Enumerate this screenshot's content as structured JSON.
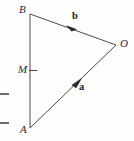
{
  "figure": {
    "kind": "vector-triangle-diagram",
    "background_color": "#fdfdfc",
    "stroke_color": "#4a4a4a",
    "label_color": "#2b2b2b",
    "vertices": [
      {
        "name": "B",
        "label": "B",
        "x": 30,
        "y": 14
      },
      {
        "name": "O",
        "label": "O",
        "x": 116,
        "y": 45
      },
      {
        "name": "A",
        "label": "A",
        "x": 30,
        "y": 128
      },
      {
        "name": "M",
        "label": "M",
        "x": 30,
        "y": 70
      }
    ],
    "segments": [
      {
        "name": "segment-BA",
        "from": "B",
        "to": "A"
      },
      {
        "name": "segment-BO",
        "from": "B",
        "to": "O"
      },
      {
        "name": "segment-AO",
        "from": "A",
        "to": "O"
      }
    ],
    "vectors": [
      {
        "name": "vector-b",
        "label": "b",
        "from": "O",
        "to": "B",
        "arrow_x": 71,
        "arrow_y": 28,
        "label_x": 72,
        "label_y": 11
      },
      {
        "name": "vector-a",
        "label": "a",
        "from": "A",
        "to": "O",
        "arrow_x": 77,
        "arrow_y": 83,
        "label_x": 79,
        "label_y": 82
      }
    ],
    "midpoint_tick": {
      "name": "midpoint-tick-M",
      "x1": 29,
      "y1": 70,
      "x2": 37,
      "y2": 70
    },
    "edge_marks": [
      {
        "name": "edge-dash-upper",
        "x1": 0,
        "y1": 94,
        "x2": 9,
        "y2": 94
      },
      {
        "name": "edge-dash-lower",
        "x1": 0,
        "y1": 123,
        "x2": 9,
        "y2": 123
      }
    ]
  }
}
